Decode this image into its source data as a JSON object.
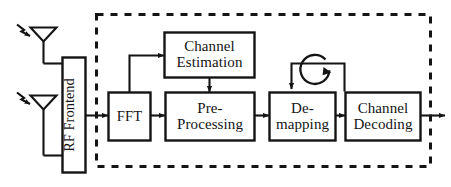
{
  "diagram": {
    "stroke_color": "#141414",
    "background_color": "#ffffff",
    "boundary": {
      "name": "baseband-processing-boundary",
      "style": "dashed",
      "label": ""
    },
    "antennas": [
      {
        "name": "antenna-upper",
        "label": "",
        "incoming_signal": "rf-wave"
      },
      {
        "name": "antenna-lower",
        "label": "",
        "incoming_signal": "rf-wave"
      }
    ],
    "blocks": [
      {
        "id": "rf-frontend",
        "label": "RF Frontend",
        "lines": [
          "RF Frontend"
        ],
        "orientation": "vertical"
      },
      {
        "id": "fft",
        "label": "FFT",
        "lines": [
          "FFT"
        ],
        "orientation": "horizontal"
      },
      {
        "id": "channel-estimation",
        "label": "Channel Estimation",
        "lines": [
          "Channel",
          "Estimation"
        ],
        "orientation": "horizontal"
      },
      {
        "id": "pre-processing",
        "label": "Pre-Processing",
        "lines": [
          "Pre-",
          "Processing"
        ],
        "orientation": "horizontal"
      },
      {
        "id": "de-mapping",
        "label": "De-mapping",
        "lines": [
          "De-",
          "mapping"
        ],
        "orientation": "horizontal"
      },
      {
        "id": "channel-decoding",
        "label": "Channel Decoding",
        "lines": [
          "Channel",
          "Decoding"
        ],
        "orientation": "horizontal"
      }
    ],
    "connections": [
      {
        "from": "antenna-upper",
        "to": "rf-frontend",
        "arrow": false
      },
      {
        "from": "antenna-lower",
        "to": "rf-frontend",
        "arrow": false
      },
      {
        "from": "rf-frontend",
        "to": "fft",
        "arrow": true
      },
      {
        "from": "fft-input-tap",
        "to": "channel-estimation",
        "arrow": true
      },
      {
        "from": "channel-estimation",
        "to": "pre-processing",
        "arrow": true
      },
      {
        "from": "fft",
        "to": "pre-processing",
        "arrow": true
      },
      {
        "from": "pre-processing",
        "to": "de-mapping",
        "arrow": true
      },
      {
        "from": "de-mapping",
        "to": "channel-decoding",
        "arrow": true
      },
      {
        "from": "channel-decoding-loop",
        "to": "de-mapping",
        "arrow": true,
        "note": "iterative feedback"
      },
      {
        "from": "channel-decoding",
        "to": "output",
        "arrow": true
      }
    ],
    "iteration_symbol": {
      "name": "iterative-loop-icon",
      "label": ""
    }
  }
}
